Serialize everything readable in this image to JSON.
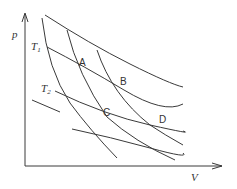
{
  "diagram": {
    "axes": {
      "y_label": "p",
      "x_label": "V"
    },
    "isotherm_labels": {
      "t1": {
        "main": "T",
        "sub": "1"
      },
      "t2": {
        "main": "T",
        "sub": "2"
      }
    },
    "points": {
      "a": "A",
      "b": "B",
      "c": "C",
      "d": "D"
    },
    "colors": {
      "line": "#3a3a3a",
      "text": "#333333",
      "background": "#ffffff"
    }
  }
}
